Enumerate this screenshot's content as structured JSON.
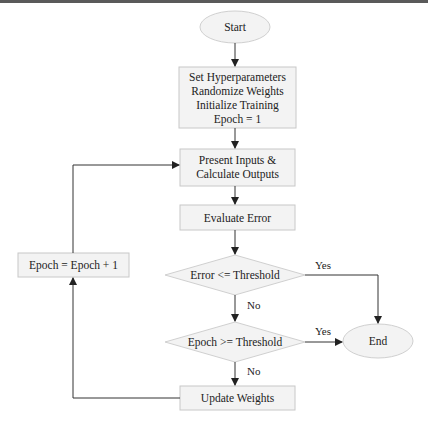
{
  "diagram": {
    "type": "flowchart",
    "nodes": {
      "start": {
        "label": "Start",
        "shape": "ellipse"
      },
      "init": {
        "lines": [
          "Set Hyperparameters",
          "Randomize Weights",
          "Initialize Training",
          "Epoch = 1"
        ],
        "shape": "rect"
      },
      "present": {
        "lines": [
          "Present Inputs &",
          "Calculate Outputs"
        ],
        "shape": "rect"
      },
      "evaluate": {
        "label": "Evaluate Error",
        "shape": "rect"
      },
      "error_check": {
        "label": "Error <= Threshold",
        "shape": "diamond"
      },
      "epoch_check": {
        "label": "Epoch >= Threshold",
        "shape": "diamond"
      },
      "update": {
        "label": "Update Weights",
        "shape": "rect"
      },
      "increment": {
        "label": "Epoch = Epoch + 1",
        "shape": "rect"
      },
      "end": {
        "label": "End",
        "shape": "ellipse"
      }
    },
    "edge_labels": {
      "error_yes": "Yes",
      "error_no": "No",
      "epoch_yes": "Yes",
      "epoch_no": "No"
    },
    "colors": {
      "fill": "#f3f3f3",
      "stroke": "#c8c8c8",
      "arrow": "#333333",
      "text": "#222222"
    }
  }
}
